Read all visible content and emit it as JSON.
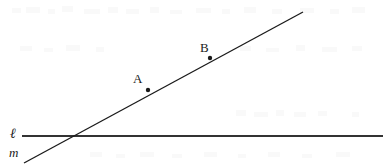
{
  "figure": {
    "type": "geometry-diagram",
    "width": 391,
    "height": 168,
    "background_color": "#ffffff",
    "ink_color": "#1a1a1a",
    "stroke_width": 1
  },
  "lines": [
    {
      "id": "line-l",
      "label": "ℓ",
      "description": "horizontal line",
      "x1": 22,
      "y1": 136,
      "x2": 383,
      "y2": 136,
      "color": "#333333"
    },
    {
      "id": "line-m",
      "label": "m",
      "description": "slanted line rising to the right",
      "x1": 24,
      "y1": 163,
      "x2": 303,
      "y2": 12,
      "color": "#1a1a1a"
    }
  ],
  "points": [
    {
      "id": "point-a",
      "label": "A",
      "x": 148,
      "y": 90,
      "radius": 2.2,
      "color": "#1a1a1a",
      "label_x": 133,
      "label_y": 72
    },
    {
      "id": "point-b",
      "label": "B",
      "x": 210,
      "y": 58,
      "radius": 2.2,
      "color": "#1a1a1a",
      "label_x": 200,
      "label_y": 41
    }
  ],
  "intersection": {
    "id": "intersection-point",
    "x": 52,
    "y": 136,
    "label": ""
  },
  "labels": {
    "point_a": "A",
    "point_b": "B",
    "line_l": "ℓ",
    "line_m": "m"
  }
}
